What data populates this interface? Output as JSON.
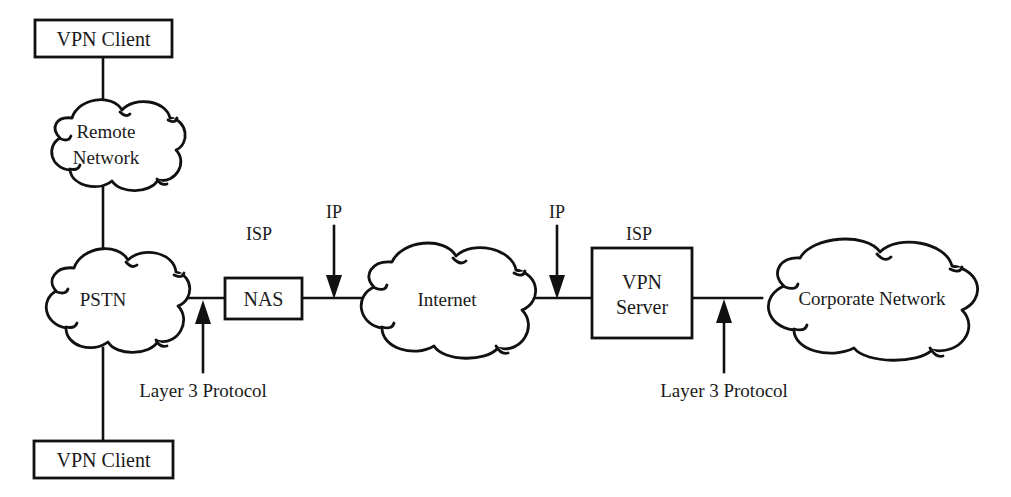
{
  "diagram": {
    "type": "network-topology",
    "nodes": {
      "vpn_client_top": "VPN Client",
      "vpn_client_bottom": "VPN Client",
      "remote_network_line1": "Remote",
      "remote_network_line2": "Network",
      "pstn": "PSTN",
      "nas": "NAS",
      "internet": "Internet",
      "vpn_server_line1": "VPN",
      "vpn_server_line2": "Server",
      "corporate_network": "Corporate Network"
    },
    "labels": {
      "isp_left": "ISP",
      "isp_right": "ISP",
      "ip_left": "IP",
      "ip_right": "IP",
      "layer3_left": "Layer 3 Protocol",
      "layer3_right": "Layer 3 Protocol"
    },
    "colors": {
      "stroke": "#111111",
      "text": "#1a1a1a",
      "background": "#ffffff"
    }
  }
}
